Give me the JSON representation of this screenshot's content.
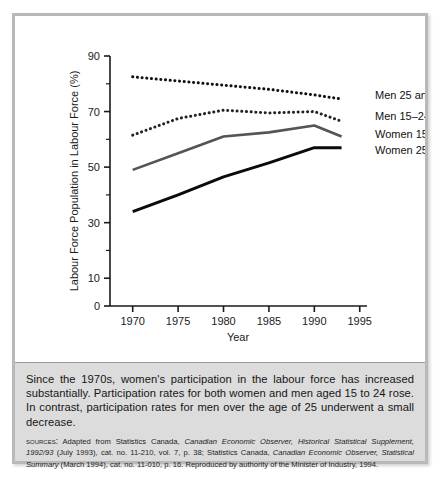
{
  "figure": {
    "caption": "Since the 1970s, women's participation in the labour force has increased substantially. Participation rates for both women and men aged 15 to 24 rose. In contrast, participation rates for men over the age of 25 underwent a small decrease.",
    "sources_label": "Sources:",
    "sources_parts": {
      "p1": " Adapted from Statistics Canada, ",
      "i1": "Canadian Economic Observer, Historical Statistical Supplement, 1992/93",
      "p2": " (July 1993), cat. no. 11-210, vol. 7, p. 38; Statistics Canada, ",
      "i2": "Canadian Economic Observer, Statistical Summary",
      "p3": " (March 1994), cat. no. 11-010, p. 16. Reproduced by authority of the Minister of Industry, 1994."
    }
  },
  "chart_data": {
    "type": "line",
    "title": "",
    "xlabel": "Year",
    "ylabel": "Labour Force Population in Labour Force (%)",
    "x": [
      1970,
      1975,
      1980,
      1985,
      1990,
      1993
    ],
    "xlim": [
      1967.5,
      1995.8
    ],
    "ylim": [
      0,
      90
    ],
    "xticks": [
      1970,
      1975,
      1980,
      1985,
      1990,
      1995
    ],
    "xtick_labels": [
      "1970",
      "1975",
      "1980",
      "1985",
      "1990",
      "1995"
    ],
    "yticks": [
      0,
      10,
      20,
      30,
      40,
      50,
      60,
      70,
      80,
      90
    ],
    "ytick_labels_major": [
      "0",
      "10",
      "30",
      "50",
      "70",
      "90"
    ],
    "ytick_major": [
      0,
      10,
      30,
      50,
      70,
      90
    ],
    "grid": false,
    "legend_position": "right-inline",
    "series": [
      {
        "name": "Men 25 and over",
        "label": "Men 25 and over",
        "style": "dotted",
        "color": "#111111",
        "width": 3,
        "values": [
          82.5,
          81.0,
          79.5,
          78.0,
          76.0,
          74.5
        ],
        "label_y_value": 76.0
      },
      {
        "name": "Men 15-24",
        "label": "Men 15–24",
        "style": "dotted",
        "color": "#222222",
        "width": 3,
        "values": [
          61.5,
          67.5,
          70.5,
          69.5,
          70.0,
          66.5
        ],
        "label_y_value": 68.5
      },
      {
        "name": "Women 15-24",
        "label": "Women 15–24",
        "style": "solid",
        "color": "#545454",
        "width": 2.6,
        "values": [
          49.0,
          55.0,
          61.0,
          62.5,
          65.0,
          61.0
        ],
        "label_y_value": 62.0
      },
      {
        "name": "Women 25 and over",
        "label": "Women 25 and over",
        "style": "solid",
        "color": "#0b0b0b",
        "width": 3,
        "values": [
          34.0,
          40.0,
          46.5,
          51.5,
          57.0,
          57.0
        ],
        "label_y_value": 56.0
      }
    ]
  }
}
